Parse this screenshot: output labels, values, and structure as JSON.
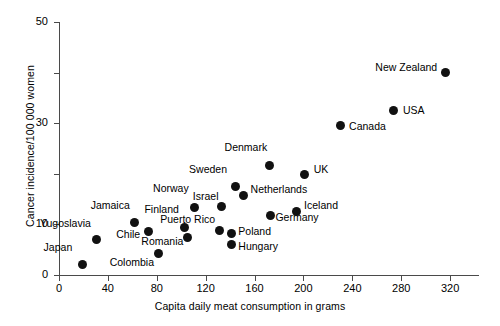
{
  "chart_data": {
    "type": "scatter",
    "title": "",
    "xlabel": "Capita daily meat consumption in grams",
    "ylabel": "Cancer incidence/100 000 women",
    "xlim": [
      0,
      324
    ],
    "ylim": [
      0,
      50
    ],
    "xticks": [
      0,
      40,
      80,
      120,
      160,
      200,
      240,
      280,
      320
    ],
    "yticks_major": [
      0,
      10,
      30,
      50
    ],
    "yticks_minor": [
      20,
      40
    ],
    "grid": false,
    "legend": "none",
    "points": [
      {
        "label": "Japan",
        "x": 19,
        "y": 2.0,
        "label_dx": -10,
        "label_dy": -18,
        "label_align": "right"
      },
      {
        "label": "Yugoslavia",
        "x": 31,
        "y": 7.0,
        "label_dx": -6,
        "label_dy": -17,
        "label_align": "right"
      },
      {
        "label": "Jamaica",
        "x": 62,
        "y": 10.4,
        "label_dx": -5,
        "label_dy": -17,
        "label_align": "right"
      },
      {
        "label": "Chile",
        "x": 73,
        "y": 8.5,
        "label_dx": -8,
        "label_dy": 2,
        "label_align": "right"
      },
      {
        "label": "Colombia",
        "x": 81,
        "y": 4.2,
        "label_dx": -4,
        "label_dy": 8,
        "label_align": "right"
      },
      {
        "label": "Finland",
        "x": 103,
        "y": 9.4,
        "label_dx": -6,
        "label_dy": -18,
        "label_align": "right"
      },
      {
        "label": "Romania",
        "x": 105,
        "y": 7.5,
        "label_dx": -4,
        "label_dy": 4,
        "label_align": "right"
      },
      {
        "label": "Norway",
        "x": 111,
        "y": 13.4,
        "label_dx": -6,
        "label_dy": -19,
        "label_align": "right"
      },
      {
        "label": "Puerto Rico",
        "x": 131,
        "y": 8.7,
        "label_dx": -4,
        "label_dy": -12,
        "label_align": "right"
      },
      {
        "label": "Israel",
        "x": 133,
        "y": 13.5,
        "label_dx": -3,
        "label_dy": -11,
        "label_align": "right"
      },
      {
        "label": "Poland",
        "x": 141,
        "y": 8.2,
        "label_dx": 7,
        "label_dy": -3,
        "label_align": "left"
      },
      {
        "label": "Hungary",
        "x": 141,
        "y": 6.0,
        "label_dx": 7,
        "label_dy": 1,
        "label_align": "left"
      },
      {
        "label": "Sweden",
        "x": 144,
        "y": 17.5,
        "label_dx": -8,
        "label_dy": -17,
        "label_align": "right"
      },
      {
        "label": "Netherlands",
        "x": 151,
        "y": 15.7,
        "label_dx": 7,
        "label_dy": -7,
        "label_align": "left"
      },
      {
        "label": "Denmark",
        "x": 172,
        "y": 21.6,
        "label_dx": -2,
        "label_dy": -19,
        "label_align": "right"
      },
      {
        "label": "Germany",
        "x": 173,
        "y": 11.8,
        "label_dx": 5,
        "label_dy": 2,
        "label_align": "left"
      },
      {
        "label": "Iceland",
        "x": 194,
        "y": 12.6,
        "label_dx": 8,
        "label_dy": -6,
        "label_align": "left"
      },
      {
        "label": "UK",
        "x": 201,
        "y": 19.8,
        "label_dx": 9,
        "label_dy": -6,
        "label_align": "left"
      },
      {
        "label": "Canada",
        "x": 230,
        "y": 29.6,
        "label_dx": 9,
        "label_dy": 1,
        "label_align": "left"
      },
      {
        "label": "USA",
        "x": 274,
        "y": 32.5,
        "label_dx": 9,
        "label_dy": -1,
        "label_align": "left"
      },
      {
        "label": "New Zealand",
        "x": 316,
        "y": 40.0,
        "label_dx": -8,
        "label_dy": -6,
        "label_align": "right"
      }
    ]
  },
  "axes": {
    "y_title": "Cancer incidence/100 000 women",
    "x_title": "Capita daily meat consumption in grams",
    "y_labels": [
      "0",
      "10",
      "30",
      "50"
    ],
    "x_labels": [
      "0",
      "40",
      "80",
      "120",
      "160",
      "200",
      "240",
      "280",
      "320"
    ]
  },
  "colors": {
    "point": "#111111",
    "axis": "#4a4a4a",
    "text": "#000000",
    "background": "#ffffff"
  }
}
